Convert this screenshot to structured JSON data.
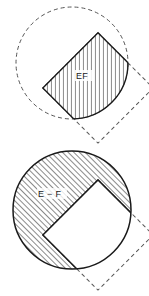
{
  "figure": {
    "background_color": "#ffffff",
    "width": 149,
    "height": 296,
    "stroke_color": "#1a1a1a",
    "hatch_color": "#2a2a2a",
    "dash_color": "#555555"
  },
  "panels": [
    {
      "id": "intersection",
      "label": "EF",
      "label_x": 79,
      "label_y": 78,
      "description": "Hatched region is the intersection of circle E and square F",
      "circle": {
        "cx": 72,
        "cy": 63,
        "r": 56,
        "style": "dashed",
        "fill": "none"
      },
      "square": {
        "cx": 98,
        "cy": 88,
        "half": 39,
        "rotation_deg": 45,
        "style": "dashed",
        "fill": "none"
      },
      "shaded_region": {
        "type": "intersection",
        "border": "solid",
        "fill": "hatch"
      }
    },
    {
      "id": "difference",
      "label": "E − F",
      "label_x": 40,
      "label_y": 196,
      "description": "Hatched region is circle E minus square F",
      "circle": {
        "cx": 72,
        "cy": 210,
        "r": 59,
        "style": "solid",
        "fill": "hatch"
      },
      "square": {
        "cx": 98,
        "cy": 235,
        "half": 39,
        "rotation_deg": 45,
        "style": "dashed",
        "fill": "white"
      },
      "shaded_region": {
        "type": "difference",
        "border": "solid",
        "fill": "hatch"
      }
    }
  ]
}
